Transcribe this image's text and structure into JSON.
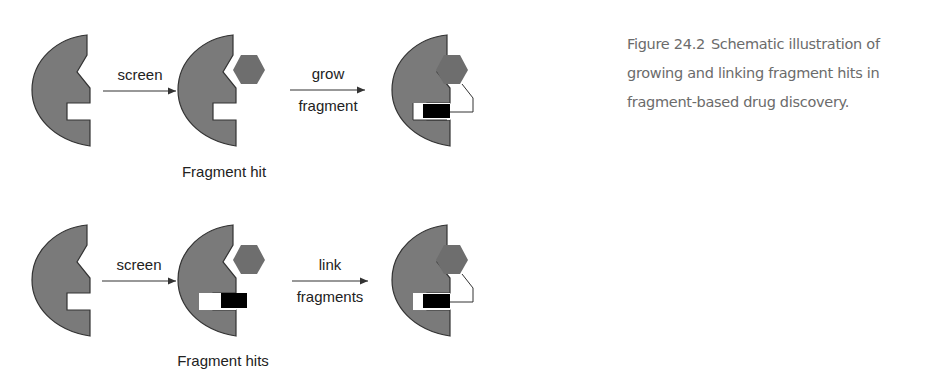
{
  "caption": {
    "figure_number": "Figure 24.2",
    "text": "Schematic illustration of growing and linking fragment hits in fragment-based drug discovery."
  },
  "rows": [
    {
      "name": "growing",
      "step1_label": "screen",
      "step2_label_top": "grow",
      "step2_label_bottom": "fragment",
      "intermediate_label": "Fragment hit"
    },
    {
      "name": "linking",
      "step1_label": "screen",
      "step2_label_top": "link",
      "step2_label_bottom": "fragments",
      "intermediate_label": "Fragment hits"
    }
  ],
  "colors": {
    "protein_fill": "#7a7a7a",
    "fragment_hexagon": "#6e6e6e",
    "fragment_rect": "#000000",
    "arrow": "#333333"
  }
}
